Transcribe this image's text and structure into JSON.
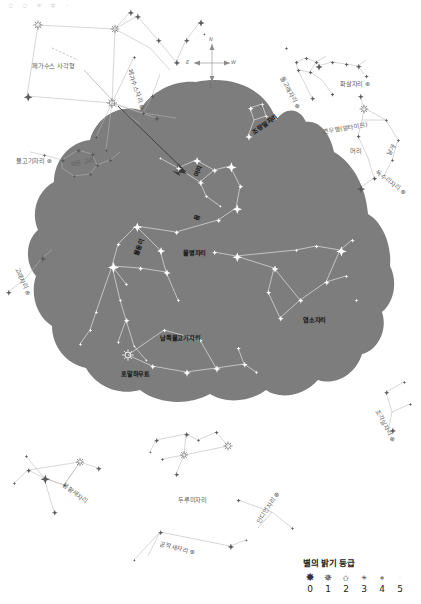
{
  "meta": {
    "width": 421,
    "height": 604
  },
  "colors": {
    "sky_fill": "#7d7d7d",
    "background": "#ffffff",
    "star_on_sky": "#ffffff",
    "star_off_sky": "#6e6e6e",
    "line_on_sky": "#d8d8d8",
    "line_off_sky": "#b9b9b9",
    "label_dark": "#1b1b1b",
    "label_gray": "#5e5e5e"
  },
  "legend": {
    "title": "별의 밝기 등급",
    "magnitudes": [
      "0",
      "1",
      "2",
      "3",
      "4",
      "5"
    ],
    "symbols": [
      "✸",
      "✵",
      "✩",
      "✳",
      "✲",
      "·"
    ]
  },
  "compass": {
    "north": "N",
    "east": "E",
    "west": "W",
    "south": "S"
  },
  "top_strip": [
    "✩",
    "✩",
    "✳",
    "✲",
    "·"
  ],
  "labels": [
    {
      "id": "pegasus-square",
      "text": "페가수스 사각형",
      "x": 32,
      "y": 61,
      "rot": 0,
      "style": "gray"
    },
    {
      "id": "pegasus",
      "text": "페가수스자리 ⊕",
      "x": 130,
      "y": 65,
      "rot": 72,
      "style": "gray"
    },
    {
      "id": "pisces",
      "text": "물고기자리 ⊕",
      "x": 16,
      "y": 156,
      "rot": 0,
      "style": "gray"
    },
    {
      "id": "circlet",
      "text": "작은 고리",
      "x": 70,
      "y": 160,
      "rot": -12,
      "style": "gray"
    },
    {
      "id": "cetus",
      "text": "고래자리 ⊕",
      "x": 17,
      "y": 263,
      "rot": 66,
      "style": "gray"
    },
    {
      "id": "equuleus",
      "text": "조랑말자리",
      "x": 253,
      "y": 128,
      "rot": -36,
      "style": "onsky"
    },
    {
      "id": "delphinus",
      "text": "돌고래자리 ⊕",
      "x": 282,
      "y": 72,
      "rot": 62,
      "style": "gray"
    },
    {
      "id": "sagitta",
      "text": "화살자리 ⊕",
      "x": 340,
      "y": 79,
      "rot": 0,
      "style": "gray"
    },
    {
      "id": "altair",
      "text": "견우별(알타이르)",
      "x": 323,
      "y": 127,
      "rot": -10,
      "style": "gray"
    },
    {
      "id": "aquila-head",
      "text": "머리",
      "x": 350,
      "y": 146,
      "rot": 0,
      "style": "gray"
    },
    {
      "id": "aquila-wing",
      "text": "날개",
      "x": 388,
      "y": 150,
      "rot": -58,
      "style": "gray"
    },
    {
      "id": "aquila",
      "text": "독수리자리 ⊕",
      "x": 377,
      "y": 167,
      "rot": 37,
      "style": "gray"
    },
    {
      "id": "aqua-head",
      "text": "머리",
      "x": 196,
      "y": 172,
      "rot": -70,
      "style": "onsky"
    },
    {
      "id": "aqua-body",
      "text": "몸",
      "x": 196,
      "y": 216,
      "rot": -70,
      "style": "onsky"
    },
    {
      "id": "aquarius",
      "text": "물병자리",
      "x": 183,
      "y": 248,
      "rot": 0,
      "style": "onsky"
    },
    {
      "id": "water-jar",
      "text": "물동이",
      "x": 136,
      "y": 251,
      "rot": -70,
      "style": "onsky"
    },
    {
      "id": "capricornus",
      "text": "염소자리",
      "x": 303,
      "y": 315,
      "rot": 0,
      "style": "onsky"
    },
    {
      "id": "pisc-austrinus",
      "text": "남쪽물고기자리",
      "x": 160,
      "y": 333,
      "rot": 0,
      "style": "onsky"
    },
    {
      "id": "fomalhaut",
      "text": "포말하우트",
      "x": 121,
      "y": 369,
      "rot": 0,
      "style": "onsky"
    },
    {
      "id": "sculptor",
      "text": "조각실자리 ⊕",
      "x": 377,
      "y": 405,
      "rot": 62,
      "style": "gray"
    },
    {
      "id": "phoenix",
      "text": "봉황새자리",
      "x": 64,
      "y": 480,
      "rot": 37,
      "style": "gray"
    },
    {
      "id": "grus",
      "text": "두루미자리",
      "x": 178,
      "y": 495,
      "rot": 0,
      "style": "gray"
    },
    {
      "id": "indus",
      "text": "인디언자리 ⊕",
      "x": 258,
      "y": 518,
      "rot": -57,
      "style": "gray"
    },
    {
      "id": "pavo",
      "text": "공작새자리 ⊕",
      "x": 160,
      "y": 539,
      "rot": 14,
      "style": "gray"
    }
  ],
  "constellations": [
    {
      "name": "페가수스 사각형",
      "on_sky": false
    },
    {
      "name": "물고기자리",
      "on_sky": false
    },
    {
      "name": "고래자리",
      "on_sky": false
    },
    {
      "name": "조랑말자리",
      "on_sky": true
    },
    {
      "name": "돌고래자리",
      "on_sky": false
    },
    {
      "name": "화살자리",
      "on_sky": false
    },
    {
      "name": "독수리자리",
      "on_sky": false
    },
    {
      "name": "물병자리",
      "on_sky": true
    },
    {
      "name": "염소자리",
      "on_sky": true
    },
    {
      "name": "남쪽물고기자리",
      "on_sky": true
    },
    {
      "name": "조각실자리",
      "on_sky": false
    },
    {
      "name": "봉황새자리",
      "on_sky": false
    },
    {
      "name": "두루미자리",
      "on_sky": false
    },
    {
      "name": "인디언자리",
      "on_sky": false
    },
    {
      "name": "공작새자리",
      "on_sky": false
    }
  ]
}
